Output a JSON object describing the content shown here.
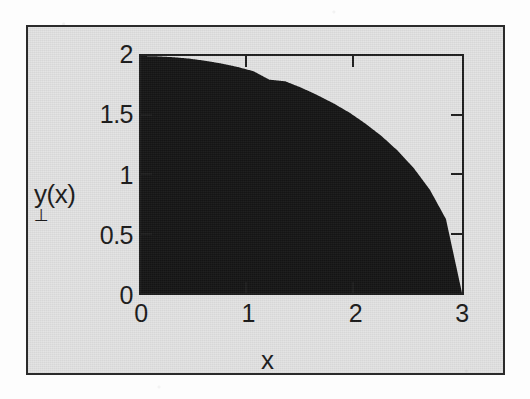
{
  "figure": {
    "panel_color": "#e3e3e3",
    "page_color": "#fdfdfd",
    "frame_color": "#2b2b2b",
    "axis_color": "#1e1e1e",
    "fill_color": "#161616"
  },
  "chart_data": {
    "type": "area",
    "title": "",
    "subtitle": "",
    "xlabel": "x",
    "ylabel": "y(x)",
    "xlim": [
      0,
      3
    ],
    "ylim": [
      0,
      2
    ],
    "grid": false,
    "legend": null,
    "legend_position": "none",
    "annotations": [],
    "xticks": [
      0,
      1,
      2,
      3
    ],
    "xticklabels": [
      "0",
      "1",
      "2",
      "3"
    ],
    "yticks": [
      0,
      0.5,
      1,
      1.5,
      2
    ],
    "yticklabels": [
      "0",
      "0.5",
      "1",
      "1.5",
      "2"
    ],
    "series": [
      {
        "name": "y(x)",
        "fill": true,
        "fill_color": "#161616",
        "baseline": 0,
        "x": [
          0,
          0.15,
          0.3,
          0.45,
          0.6,
          0.75,
          0.9,
          1.05,
          1.2,
          1.35,
          1.5,
          1.65,
          1.8,
          1.95,
          2.1,
          2.25,
          2.4,
          2.55,
          2.7,
          2.85,
          3
        ],
        "y": [
          2.0,
          1.997,
          1.99,
          1.978,
          1.96,
          1.937,
          1.908,
          1.872,
          1.8,
          1.786,
          1.732,
          1.669,
          1.6,
          1.521,
          1.428,
          1.323,
          1.2,
          1.053,
          0.871,
          0.624,
          0.0
        ]
      }
    ]
  },
  "axis": {
    "y_title": "y(x)",
    "y_artifact": "⊥",
    "x_title": "x",
    "x_tick_labels": [
      "0",
      "1",
      "2",
      "3"
    ],
    "y_tick_labels": [
      "2",
      "1.5",
      "1",
      "0.5",
      "0"
    ]
  }
}
